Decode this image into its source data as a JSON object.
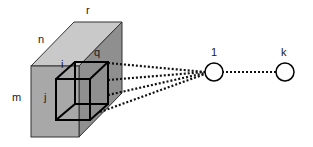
{
  "diagram": {
    "volume_labels": {
      "height": "m",
      "width": "n",
      "depth": "r"
    },
    "receptive_field_labels": {
      "width": "i",
      "height": "j",
      "depth": "q"
    },
    "neurons": [
      {
        "label": "1"
      },
      {
        "label": "k"
      }
    ],
    "colors": {
      "front_face": "#a6a6a6",
      "top_face": "#c8c8c8",
      "side_face": "#8e8e8e",
      "outline": "#000000",
      "neuron_fill": "#ffffff"
    }
  }
}
